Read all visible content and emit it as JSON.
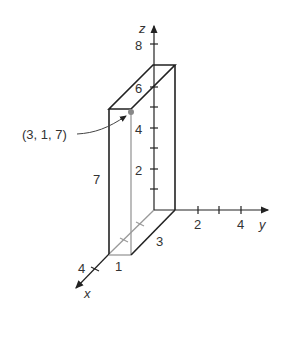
{
  "diagram": {
    "type": "3d-rectangular-box",
    "axes": {
      "x": {
        "label": "x",
        "ticks": [
          "4"
        ]
      },
      "y": {
        "label": "y",
        "ticks": [
          "2",
          "4"
        ]
      },
      "z": {
        "label": "z",
        "ticks": [
          "2",
          "4",
          "6",
          "8"
        ]
      }
    },
    "box": {
      "dimensions": {
        "x_length": "3",
        "y_length": "1",
        "z_height": "7"
      },
      "labels": {
        "height": "7",
        "depth": "3",
        "width": "1"
      }
    },
    "point": {
      "label": "(3, 1, 7)",
      "color": "#888888"
    },
    "colors": {
      "line": "#222222",
      "hidden_line": "#999999",
      "text": "#333333"
    }
  }
}
